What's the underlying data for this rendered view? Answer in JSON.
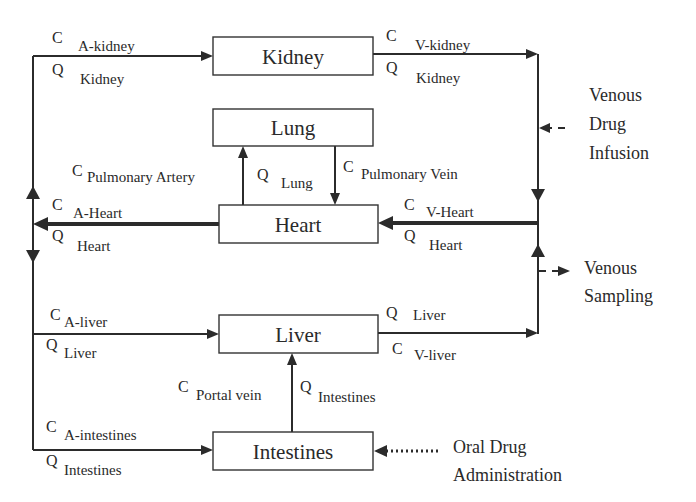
{
  "diagram": {
    "type": "pbpk-model",
    "compartments": {
      "kidney": "Kidney",
      "lung": "Lung",
      "heart": "Heart",
      "liver": "Liver",
      "intestines": "Intestines"
    },
    "flows": {
      "a_kidney": {
        "c": "C",
        "c_sub": "A-kidney",
        "q": "Q",
        "q_sub": "Kidney"
      },
      "v_kidney": {
        "c": "C",
        "c_sub": "V-kidney",
        "q": "Q",
        "q_sub": "Kidney"
      },
      "pulm_artery": {
        "c": "C",
        "c_sub": "Pulmonary Artery"
      },
      "q_lung": {
        "q": "Q",
        "q_sub": "Lung"
      },
      "pulm_vein": {
        "c": "C",
        "c_sub": "Pulmonary Vein"
      },
      "a_heart": {
        "c": "C",
        "c_sub": "A-Heart",
        "q": "Q",
        "q_sub": "Heart"
      },
      "v_heart": {
        "c": "C",
        "c_sub": "V-Heart",
        "q": "Q",
        "q_sub": "Heart"
      },
      "a_liver": {
        "c": "C",
        "c_sub": "A-liver",
        "q": "Q",
        "q_sub": "Liver"
      },
      "v_liver": {
        "q": "Q",
        "q_sub": "Liver",
        "c": "C",
        "c_sub": "V-liver"
      },
      "portal": {
        "c": "C",
        "c_sub": "Portal vein",
        "q": "Q",
        "q_sub": "Intestines"
      },
      "a_intestines": {
        "c": "C",
        "c_sub": "A-intestines",
        "q": "Q",
        "q_sub": "Intestines"
      }
    },
    "inputs": {
      "infusion": [
        "Venous",
        "Drug",
        "Infusion"
      ],
      "sampling": [
        "Venous",
        "Sampling"
      ],
      "oral": [
        "Oral Drug",
        "Administration"
      ]
    }
  }
}
